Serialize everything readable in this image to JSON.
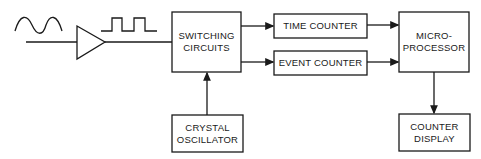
{
  "diagram": {
    "type": "block-diagram",
    "blocks": {
      "switching": {
        "line1": "SWITCHING",
        "line2": "CIRCUITS"
      },
      "time_counter": {
        "label": "TIME COUNTER"
      },
      "event_counter": {
        "label": "EVENT COUNTER"
      },
      "microprocessor": {
        "line1": "MICRO-",
        "line2": "PROCESSOR"
      },
      "crystal": {
        "line1": "CRYSTAL",
        "line2": "OSCILLATOR"
      },
      "display": {
        "line1": "COUNTER",
        "line2": "DISPLAY"
      }
    },
    "symbols": [
      "sine-wave-input",
      "amplifier",
      "square-wave-output"
    ],
    "connections": [
      [
        "input",
        "amplifier"
      ],
      [
        "amplifier",
        "switching"
      ],
      [
        "switching",
        "time_counter"
      ],
      [
        "switching",
        "event_counter"
      ],
      [
        "time_counter",
        "microprocessor"
      ],
      [
        "event_counter",
        "microprocessor"
      ],
      [
        "crystal",
        "switching"
      ],
      [
        "microprocessor",
        "display"
      ]
    ],
    "stroke_color": "#1a1a1a"
  }
}
